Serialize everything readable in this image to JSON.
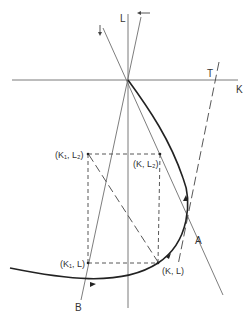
{
  "diagram": {
    "type": "phase-diagram",
    "colors": {
      "axis": "#7a7a7a",
      "line": "#6e6e6e",
      "curve": "#222222",
      "dashed": "#444444",
      "text": "#333333",
      "background": "#ffffff"
    },
    "axes": {
      "horizontal_label": "K",
      "vertical_label": "L"
    },
    "lines": {
      "tangent_label": "T",
      "line_a_label": "A",
      "line_b_label": "B"
    },
    "points": {
      "k1_l2": "(K₁, L₂)",
      "k_l2": "(K, L₂)",
      "k1_l": "(K₁, L)",
      "k_l": "(K, L)"
    },
    "arrows": {
      "left_arrow": "←",
      "down_arrow": "↓"
    }
  }
}
